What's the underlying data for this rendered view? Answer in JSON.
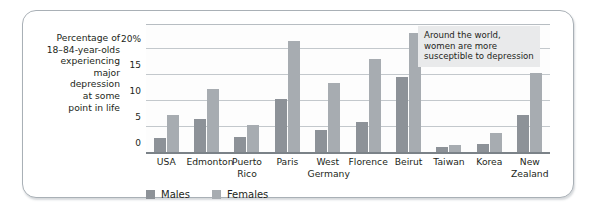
{
  "axis_caption": "Percentage of\n18–84-year-olds\nexperiencing\nmajor\ndepression\nat some\npoint in life",
  "annotation": "Around the world, women are more susceptible to depression",
  "legend": {
    "males_label": "Males",
    "females_label": "Females"
  },
  "colors": {
    "males": "#8d9298",
    "females": "#a7acb1",
    "grid": "#c3c8cc",
    "axis": "#7b8288",
    "frame": "#a9b0b6",
    "annotation_bg": "#e9eaeb",
    "text": "#231f20"
  },
  "chart_data": {
    "type": "bar",
    "title": "",
    "xlabel": "",
    "ylabel": "Percentage of 18–84-year-olds experiencing major depression at some point in life",
    "ylim": [
      0,
      24.6
    ],
    "yticks": [
      0,
      5,
      10,
      15,
      20
    ],
    "ytick_labels": [
      "0",
      "5",
      "10",
      "15",
      "20%"
    ],
    "grid": true,
    "legend_position": "bottom-left",
    "categories": [
      "USA",
      "Edmonton",
      "Puerto Rico",
      "Paris",
      "West Germany",
      "Florence",
      "Beirut",
      "Taiwan",
      "Korea",
      "New Zealand"
    ],
    "category_labels": [
      "USA",
      "Edmonton",
      "Puerto\nRico",
      "Paris",
      "West\nGermany",
      "Florence",
      "Beirut",
      "Taiwan",
      "Korea",
      "New\nZealand"
    ],
    "series": [
      {
        "name": "Males",
        "color": "#8d9298",
        "values": [
          2.8,
          6.5,
          3.1,
          10.4,
          4.5,
          6.0,
          14.6,
          1.1,
          1.7,
          7.4
        ]
      },
      {
        "name": "Females",
        "color": "#a7acb1",
        "values": [
          7.3,
          12.3,
          5.4,
          21.6,
          13.4,
          18.1,
          23.1,
          1.6,
          3.8,
          15.4
        ]
      }
    ],
    "annotations": [
      "Around the world, women are more susceptible to depression"
    ]
  }
}
